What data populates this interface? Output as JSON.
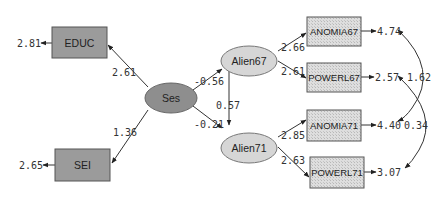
{
  "diagram": {
    "type": "structural-equation-model",
    "observed": {
      "educ": {
        "label": "EDUC",
        "error_variance": "2.81"
      },
      "sei": {
        "label": "SEI",
        "error_variance": "2.65"
      },
      "anomia67": {
        "label": "ANOMIA67",
        "error_variance": "4.74"
      },
      "powerl67": {
        "label": "POWERL67",
        "error_variance": "2.57"
      },
      "anomia71": {
        "label": "ANOMIA71",
        "error_variance": "4.40"
      },
      "powerl71": {
        "label": "POWERL71",
        "error_variance": "3.07"
      }
    },
    "latent": {
      "ses": {
        "label": "Ses"
      },
      "alien67": {
        "label": "Alien67"
      },
      "alien71": {
        "label": "Alien71"
      }
    },
    "paths": {
      "ses_educ": "2.61",
      "ses_sei": "1.36",
      "ses_alien67": "-0.56",
      "ses_alien71": "-0.21",
      "alien67_alien71": "0.57",
      "alien67_anomia67": "2.66",
      "alien67_powerl67": "2.61",
      "alien71_anomia71": "2.85",
      "alien71_powerl71": "2.63"
    },
    "covariances": {
      "anomia67_anomia71": "1.62",
      "powerl67_powerl71": "0.34"
    },
    "colors": {
      "dark_fill": "#9b9b9b",
      "light_fill": "#d6d6d6",
      "stroke": "#555555"
    }
  }
}
